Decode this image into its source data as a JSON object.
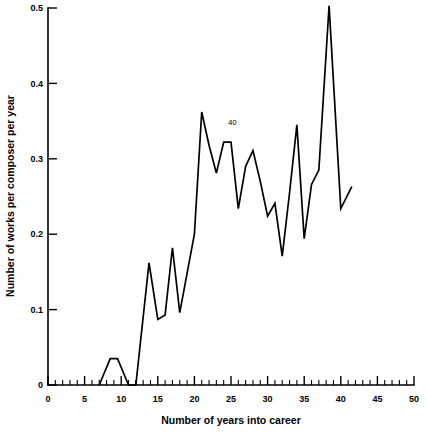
{
  "chart_data": {
    "type": "line",
    "title": "",
    "xlabel": "Number of years into career",
    "ylabel": "Number of works per composer per year",
    "xlim": [
      0,
      50
    ],
    "ylim": [
      0,
      0.5
    ],
    "grid": false,
    "legend": null,
    "x_ticks_major": [
      0,
      5,
      10,
      15,
      20,
      25,
      30,
      35,
      40,
      45,
      50
    ],
    "x_tick_labels": [
      "0",
      "5",
      "10",
      "15",
      "20",
      "25",
      "30",
      "35",
      "40",
      "45",
      "50"
    ],
    "x_minor_tick_step": 1,
    "y_ticks_major": [
      0,
      0.1,
      0.2,
      0.3,
      0.4,
      0.5
    ],
    "y_tick_labels": [
      "0",
      "0.1",
      "0.2",
      "0.3",
      "0.4",
      "0.5"
    ],
    "annotations": [
      {
        "text": "40",
        "x": 25.2,
        "y": 0.345
      }
    ],
    "series": [
      {
        "name": "works per composer per year",
        "x": [
          7.0,
          8.5,
          9.5,
          11.0,
          12.0,
          13.8,
          15.0,
          16.0,
          17.0,
          18.0,
          20.0,
          21.0,
          22.0,
          23.0,
          24.0,
          25.0,
          26.0,
          27.0,
          28.0,
          29.0,
          30.0,
          31.0,
          32.0,
          33.0,
          34.0,
          35.0,
          36.0,
          37.0,
          38.4,
          40.0,
          41.5
        ],
        "y": [
          0.0,
          0.035,
          0.035,
          0.0,
          0.0,
          0.162,
          0.087,
          0.093,
          0.182,
          0.096,
          0.2,
          0.362,
          0.318,
          0.281,
          0.322,
          0.322,
          0.234,
          0.29,
          0.311,
          0.27,
          0.224,
          0.241,
          0.171,
          0.255,
          0.345,
          0.194,
          0.266,
          0.285,
          0.503,
          0.234,
          0.263
        ]
      }
    ]
  }
}
